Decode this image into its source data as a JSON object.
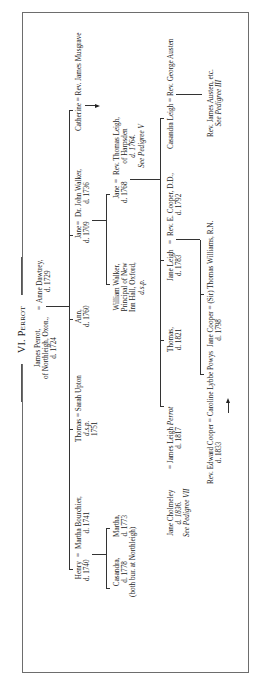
{
  "page": {
    "title": "VI. Perrot"
  },
  "pedigree": {
    "generation_1": {
      "james_perrot": {
        "name": "James Perrot,",
        "place": "of Northleigh, Oxon.,",
        "death": "d. 1724"
      },
      "marriage_sign": "=",
      "anne_dawtrey": {
        "name": "Anne Dawtrey,",
        "death": "d. 1729"
      }
    },
    "generation_2": {
      "henry": {
        "name": "Henry",
        "death": "d. 1740"
      },
      "henry_marriage_sign": "=",
      "martha_bourchier": {
        "name": "Martha Bourchier,",
        "death": "d. 1741"
      },
      "thomas": {
        "name": "Thomas",
        "marriage": "= Sarah Upton",
        "line2": "d.s.p.",
        "line3": "1751"
      },
      "ann": {
        "name": "Ann,",
        "death": "d. 1760"
      },
      "jane_walker": {
        "name": "Jane",
        "death": "d. 1709"
      },
      "jane_walker_marriage_sign": "=",
      "dr_john_walker": {
        "name": "Dr. John Walker,",
        "death": "d. 1736"
      },
      "catherine": {
        "name": "Catherine",
        "marriage": "= Rev. James Musgrave"
      }
    },
    "generation_3": {
      "casandra": {
        "name": "Casandra,",
        "death": "d. 1778",
        "note": "(both bur. at Northleigh)"
      },
      "martha": {
        "name": "Martha,",
        "death": "d. 1773"
      },
      "william_walker": {
        "name": "William Walker,",
        "line2": "Principal of New",
        "line3": "Inn Hall, Oxford,",
        "line4": "d.s.p."
      },
      "jane_leigh_senior": {
        "name": "Jane",
        "death": "d. 1768"
      },
      "jane_leigh_senior_marriage_sign": "=",
      "rev_thomas_leigh": {
        "name": "Rev. Thomas Leigh,",
        "line2": "of Harpsden",
        "line3": "d. 1764.",
        "line4": "See Pedigree V"
      }
    },
    "generation_4": {
      "jane_cholmeley": {
        "name": "Jane Cholmeley",
        "death": "d. 1836.",
        "see": "See Pedigree VII"
      },
      "james_leigh_perrot": {
        "marriage_sign": "=",
        "name": "James Leigh",
        "surname_italic": "Perrot",
        "death": "d. 1817"
      },
      "thomas_leigh": {
        "name": "Thomas,",
        "death": "d. 1821"
      },
      "jane_leigh": {
        "name": "Jane Leigh",
        "death": "d. 1783"
      },
      "jane_leigh_marriage_sign": "=",
      "rev_e_cooper": {
        "name": "Rev. E. Cooper, D.D.,",
        "death": "d. 1792"
      },
      "casandra_leigh": {
        "name": "Casandra Leigh",
        "marriage": "= Rev. George Austen"
      }
    },
    "generation_5": {
      "rev_edward_cooper": {
        "name": "Rev. Edward Cooper",
        "marriage": "= Caroline Lybbe Powys",
        "death": "d. 1833"
      },
      "jane_cooper": {
        "name": "Jane Cooper",
        "marriage": "= (Sir) Thomas Williams, R.N.",
        "death": "d. 1798"
      },
      "rev_james_austen": {
        "name": "Rev. James Austen, etc.",
        "see": "See Pedigree III"
      }
    }
  }
}
